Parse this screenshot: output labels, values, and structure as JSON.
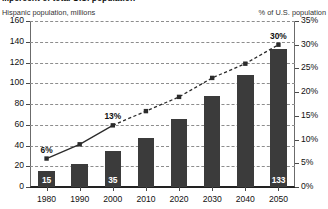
{
  "chart_data": {
    "type": "bar",
    "title": "...percent of total U.S. population",
    "title_cropped": true,
    "categories": [
      "1980",
      "1990",
      "2000",
      "2010",
      "2020",
      "2030",
      "2040",
      "2050"
    ],
    "xlabel": "",
    "ylabel": "Hispanic population, millions",
    "ylabel_right": "% of U.S. population",
    "ylim": [
      0,
      160
    ],
    "ylim_right": [
      0,
      35
    ],
    "yticks": [
      "0",
      "20",
      "40",
      "60",
      "80",
      "100",
      "120",
      "140",
      "160"
    ],
    "yticks_right": [
      "0%",
      "5%",
      "10%",
      "15%",
      "20%",
      "25%",
      "30%",
      "35%"
    ],
    "grid": true,
    "legend": "none",
    "series": [
      {
        "name": "Hispanic population, millions",
        "type": "bar",
        "axis": "left",
        "color": "#3b3b3b",
        "values": [
          15,
          22,
          35,
          47,
          66,
          88,
          108,
          133
        ],
        "point_labels": [
          "15",
          "",
          "35",
          "",
          "",
          "",
          "",
          "133"
        ]
      },
      {
        "name": "% of U.S. population",
        "type": "line",
        "axis": "right",
        "color": "#2b2b2b",
        "values": [
          6,
          9,
          13,
          16,
          19,
          23,
          26,
          30
        ],
        "solid_through": "2000",
        "point_labels": [
          "6%",
          "",
          "13%",
          "",
          "",
          "",
          "",
          "30%"
        ]
      }
    ],
    "annotations": [
      {
        "text": "6%",
        "category": "1980",
        "value": 6
      },
      {
        "text": "13%",
        "category": "2000",
        "value": 13
      },
      {
        "text": "30%",
        "category": "2050",
        "value": 30
      },
      {
        "text": "15",
        "category": "1980",
        "value": 15
      },
      {
        "text": "35",
        "category": "2000",
        "value": 35
      },
      {
        "text": "133",
        "category": "2050",
        "value": 133
      }
    ]
  }
}
